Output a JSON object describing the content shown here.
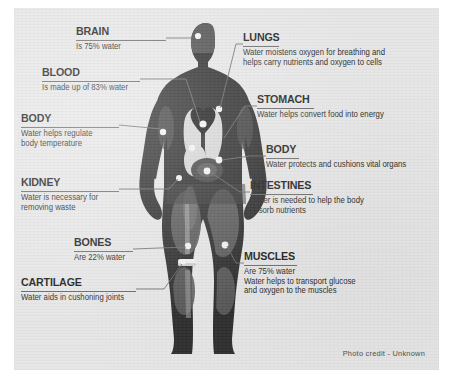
{
  "poster": {
    "credit": "Photo credit - Unknown",
    "background_color": "#e6e6e6",
    "outer_color": "#ffffff",
    "figure_color": "#2b2b2b",
    "organ_light_color": "#d8d8d8",
    "muscle_shade_color": "#5e5e5e",
    "marker_color": "#f2f2f2",
    "leader_color": "#6a6a6a",
    "title_color": "#1d1d1d"
  },
  "callouts": [
    {
      "id": "brain",
      "title": "BRAIN",
      "lines": [
        "Is 75% water"
      ],
      "side": "left"
    },
    {
      "id": "blood",
      "title": "BLOOD",
      "lines": [
        "Is made up of 83% water"
      ],
      "side": "left"
    },
    {
      "id": "body-left",
      "title": "BODY",
      "lines": [
        "Water helps regulate",
        "body temperature"
      ],
      "side": "left"
    },
    {
      "id": "kidney",
      "title": "KIDNEY",
      "lines": [
        "Water is necessary for",
        "removing waste"
      ],
      "side": "left"
    },
    {
      "id": "bones",
      "title": "BONES",
      "lines": [
        "Are 22% water"
      ],
      "side": "left"
    },
    {
      "id": "cartilage",
      "title": "CARTILAGE",
      "lines": [
        "Water aids in cushoning joints"
      ],
      "side": "left"
    },
    {
      "id": "lungs",
      "title": "LUNGS",
      "lines": [
        "Water moistens oxygen for breathing and",
        "helps carry nutrients and oxygen to cells"
      ],
      "side": "right"
    },
    {
      "id": "stomach",
      "title": "STOMACH",
      "lines": [
        "Water helps convert food into energy"
      ],
      "side": "right"
    },
    {
      "id": "body-right",
      "title": "BODY",
      "lines": [
        "Water protects and cushions vital organs"
      ],
      "side": "right"
    },
    {
      "id": "intestines",
      "title": "INTESTINES",
      "lines": [
        "Water is needed to help the body",
        "absorb nutrients"
      ],
      "side": "right"
    },
    {
      "id": "muscles",
      "title": "MUSCLES",
      "lines": [
        "Are 75% water",
        "Water helps to transport glucose",
        "and oxygen to the muscles"
      ],
      "side": "right"
    }
  ]
}
